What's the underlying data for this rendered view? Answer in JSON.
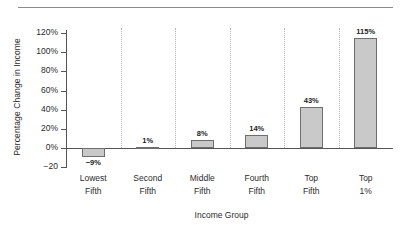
{
  "chart_data": {
    "type": "bar",
    "title": "",
    "xlabel": "Income Group",
    "ylabel": "Percentage Change in Income",
    "categories": [
      "Lowest Fifth",
      "Second Fifth",
      "Middle Fifth",
      "Fourth Fifth",
      "Top Fifth",
      "Top 1%"
    ],
    "category_lines": [
      [
        "Lowest",
        "Fifth"
      ],
      [
        "Second",
        "Fifth"
      ],
      [
        "Middle",
        "Fifth"
      ],
      [
        "Fourth",
        "Fifth"
      ],
      [
        "Top",
        "Fifth"
      ],
      [
        "Top",
        "1%"
      ]
    ],
    "values": [
      -9,
      1,
      8,
      14,
      43,
      115
    ],
    "data_labels": [
      "−9%",
      "1%",
      "8%",
      "14%",
      "43%",
      "115%"
    ],
    "ylim": [
      -20,
      130
    ],
    "ytick_values": [
      120,
      100,
      80,
      60,
      40,
      20,
      0,
      -20
    ],
    "ytick_labels": [
      "120%",
      "100%",
      "80%",
      "60%",
      "40%",
      "20%",
      "0%",
      "−20"
    ],
    "grid": "vertical-dotted-category-separators",
    "legend": "none",
    "bar_fill_color": "#c9c9c9",
    "bar_edge_color": "#6e6e6e",
    "axis_color": "#555555",
    "gridline_color": "#b4b4b4",
    "text_color": "#2b2b2b"
  }
}
